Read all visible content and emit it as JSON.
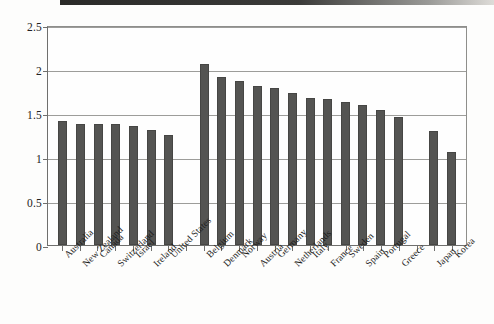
{
  "chart_data": {
    "type": "bar",
    "title": "",
    "subtitle": "",
    "xlabel": "",
    "ylabel": "",
    "ylim": [
      0,
      2.5
    ],
    "ytick_values": [
      0,
      0.5,
      1,
      1.5,
      2,
      2.5
    ],
    "ytick_labels": [
      "0",
      "0.5",
      "1",
      "1.5",
      "2",
      "2.5"
    ],
    "grid": true,
    "legend": null,
    "legend_position": "none",
    "orientation": "vertical",
    "bar_color": "#545452",
    "categories": [
      "Australia",
      "New Zealand",
      "Canada",
      "Switzerland",
      "Israel",
      "Ireland",
      "United States",
      "",
      "Belgium",
      "Denmark",
      "Norway",
      "Austria",
      "Germany",
      "Netherlands",
      "Italy",
      "France",
      "Sweden",
      "Spain",
      "Portugal",
      "Greece",
      "",
      "Japan",
      "Korea"
    ],
    "values": [
      1.41,
      1.38,
      1.37,
      1.37,
      1.35,
      1.31,
      1.25,
      null,
      2.06,
      1.91,
      1.86,
      1.81,
      1.79,
      1.73,
      1.67,
      1.66,
      1.62,
      1.59,
      1.53,
      1.46,
      null,
      1.3,
      1.06
    ],
    "groups": [
      {
        "name": "",
        "categories": [
          "Australia",
          "New Zealand",
          "Canada",
          "Switzerland",
          "Israel",
          "Ireland",
          "United States"
        ]
      },
      {
        "name": "",
        "categories": [
          "Belgium",
          "Denmark",
          "Norway",
          "Austria",
          "Germany",
          "Netherlands",
          "Italy",
          "France",
          "Sweden",
          "Spain",
          "Portugal",
          "Greece"
        ]
      },
      {
        "name": "",
        "categories": [
          "Japan",
          "Korea"
        ]
      }
    ],
    "annotations": []
  }
}
